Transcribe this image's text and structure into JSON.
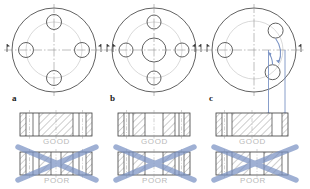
{
  "figure": {
    "background": "#ffffff",
    "line_color": "#3a3a3a",
    "center_line_color": "#8a8a8a",
    "bolt_circle_color": "#c9c9c9",
    "hatch_color": "#555555",
    "annotation_color": "#7b93c4",
    "caption_color": "#b9b9b9"
  },
  "columns": [
    {
      "key": "a",
      "label": "a",
      "front_view": {
        "name": "flange-front-view-a",
        "outer_diameter_px": 84,
        "bolt_circle_diameter_px": 56,
        "hole_diameter_px": 15,
        "has_center_bore": false,
        "center_bore_diameter_px": 0,
        "hole_angles_deg": [
          0,
          90,
          180,
          270
        ],
        "section_arrows": [
          "left",
          "right"
        ],
        "rotation_arrows": false
      },
      "sections": [
        {
          "caption": "GOOD",
          "verdict": "good",
          "crossed_out": false,
          "hatched_bands": [
            [
              26,
              74
            ]
          ],
          "hole_bands": [
            [
              8,
              20
            ],
            [
              80,
              92
            ]
          ]
        },
        {
          "caption": "POOR",
          "verdict": "poor",
          "crossed_out": true,
          "hatched_bands": [
            [
              26,
              44
            ],
            [
              56,
              74
            ]
          ],
          "hole_bands": [
            [
              8,
              20
            ],
            [
              80,
              92
            ]
          ]
        }
      ]
    },
    {
      "key": "b",
      "label": "b",
      "front_view": {
        "name": "flange-front-view-b",
        "outer_diameter_px": 84,
        "bolt_circle_diameter_px": 56,
        "hole_diameter_px": 14,
        "has_center_bore": true,
        "center_bore_diameter_px": 24,
        "hole_angles_deg": [
          0,
          90,
          180,
          270
        ],
        "section_arrows": [
          "left",
          "right"
        ],
        "rotation_arrows": false
      },
      "sections": [
        {
          "caption": "GOOD",
          "verdict": "good",
          "crossed_out": false,
          "hatched_bands": [
            [
              22,
              38
            ],
            [
              62,
              78
            ]
          ],
          "hole_bands": [
            [
              7,
              19
            ],
            [
              81,
              93
            ]
          ]
        },
        {
          "caption": "POOR",
          "verdict": "poor",
          "crossed_out": true,
          "hatched_bands": [
            [
              22,
              38
            ],
            [
              62,
              78
            ]
          ],
          "hole_bands": [
            [
              7,
              19
            ],
            [
              81,
              93
            ]
          ]
        }
      ]
    },
    {
      "key": "c",
      "label": "c",
      "front_view": {
        "name": "flange-front-view-c",
        "outer_diameter_px": 84,
        "bolt_circle_diameter_px": 58,
        "hole_diameter_px": 15,
        "has_center_bore": false,
        "center_bore_diameter_px": 0,
        "hole_angles_deg": [
          180,
          42,
          -50
        ],
        "section_arrows": [
          "left",
          "right"
        ],
        "rotation_arrows": true,
        "projection_lines": 2
      },
      "sections": [
        {
          "caption": "GOOD",
          "verdict": "good",
          "crossed_out": false,
          "hatched_bands": [
            [
              22,
              76
            ]
          ],
          "hole_bands": [
            [
              6,
              18
            ],
            [
              84,
              95
            ]
          ]
        },
        {
          "caption": "POOR",
          "verdict": "poor",
          "crossed_out": true,
          "hatched_bands": [
            [
              22,
              46
            ],
            [
              66,
              90
            ]
          ],
          "hole_bands": [
            [
              6,
              18
            ]
          ]
        }
      ]
    }
  ],
  "captions": {
    "good": "GOOD",
    "poor": "POOR"
  }
}
